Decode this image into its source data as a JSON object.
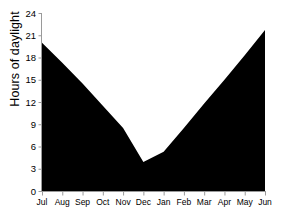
{
  "chart_data": {
    "type": "area",
    "title": "",
    "xlabel": "",
    "ylabel": "Hours of daylight",
    "categories": [
      "Jul",
      "Aug",
      "Sep",
      "Oct",
      "Nov",
      "Dec",
      "Jan",
      "Feb",
      "Mar",
      "Apr",
      "May",
      "Jun"
    ],
    "values": [
      20.0,
      17.3,
      14.5,
      11.5,
      8.5,
      3.9,
      5.3,
      8.5,
      11.8,
      15.0,
      18.3,
      21.7
    ],
    "ylim": [
      0,
      24
    ],
    "yticks": [
      0,
      3,
      6,
      9,
      12,
      15,
      18,
      21,
      24
    ],
    "ytick_labels": [
      "0",
      "3",
      "6",
      "9",
      "12",
      "15",
      "18",
      "21",
      "24"
    ],
    "grid": false,
    "legend": "none",
    "series_color": "#000000",
    "axis_color": "#9a9a9a"
  }
}
